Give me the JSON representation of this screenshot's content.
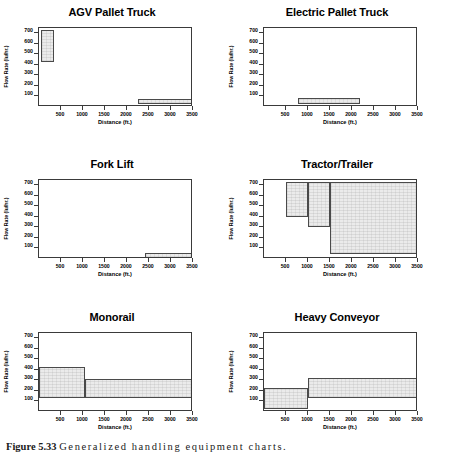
{
  "figure": {
    "caption_label": "Figure 5.33",
    "caption_text": "Generalized handling equipment charts."
  },
  "axes": {
    "xlabel": "Distance (ft.)",
    "ylabel": "Flow Rate (lu/hr.)",
    "xticks": [
      500,
      1000,
      1500,
      2000,
      2500,
      3000,
      3500
    ],
    "yticks": [
      100,
      200,
      300,
      400,
      500,
      600,
      700
    ],
    "xlim": [
      0,
      3500
    ],
    "ylim": [
      0,
      750
    ],
    "grid": false,
    "fill_color": "#ebebeb",
    "line_color": "#4a4a4a"
  },
  "panels": [
    {
      "title": "AGV Pallet Truck",
      "regions": [
        {
          "x0": 40,
          "x1": 350,
          "y0": 430,
          "y1": 735
        },
        {
          "x0": 2250,
          "x1": 3500,
          "y0": 30,
          "y1": 75
        }
      ]
    },
    {
      "title": "Electric Pallet Truck",
      "regions": [
        {
          "x0": 780,
          "x1": 2180,
          "y0": 30,
          "y1": 85
        }
      ]
    },
    {
      "title": "Fork Lift",
      "regions": [
        {
          "x0": 2420,
          "x1": 3500,
          "y0": 10,
          "y1": 55
        }
      ]
    },
    {
      "title": "Tractor/Trailer",
      "regions": [
        {
          "x0": 500,
          "x1": 1000,
          "y0": 400,
          "y1": 735
        },
        {
          "x0": 1000,
          "x1": 1500,
          "y0": 300,
          "y1": 735
        },
        {
          "x0": 1500,
          "x1": 3500,
          "y0": 50,
          "y1": 735
        }
      ]
    },
    {
      "title": "Monorail",
      "regions": [
        {
          "x0": 0,
          "x1": 1050,
          "y0": 130,
          "y1": 430
        },
        {
          "x0": 1050,
          "x1": 3500,
          "y0": 130,
          "y1": 310
        }
      ]
    },
    {
      "title": "Heavy Conveyor",
      "regions": [
        {
          "x0": 0,
          "x1": 1000,
          "y0": 30,
          "y1": 230
        },
        {
          "x0": 1000,
          "x1": 3500,
          "y0": 130,
          "y1": 320
        }
      ]
    }
  ],
  "chart_data": {
    "type": "area",
    "title": "Generalized handling equipment charts.",
    "xlabel": "Distance (ft.)",
    "ylabel": "Flow Rate (lu/hr.)",
    "xlim": [
      0,
      3500
    ],
    "ylim": [
      0,
      750
    ],
    "xticks": [
      500,
      1000,
      1500,
      2000,
      2500,
      3000,
      3500
    ],
    "yticks": [
      100,
      200,
      300,
      400,
      500,
      600,
      700
    ],
    "grid": false,
    "legend": null,
    "panel_layout": [
      2,
      3
    ],
    "series": [
      {
        "name": "AGV Pallet Truck",
        "envelope": [
          {
            "distance_from": 40,
            "distance_to": 350,
            "flow_min": 430,
            "flow_max": 735
          },
          {
            "distance_from": 2250,
            "distance_to": 3500,
            "flow_min": 30,
            "flow_max": 75
          }
        ]
      },
      {
        "name": "Electric Pallet Truck",
        "envelope": [
          {
            "distance_from": 780,
            "distance_to": 2180,
            "flow_min": 30,
            "flow_max": 85
          }
        ]
      },
      {
        "name": "Fork Lift",
        "envelope": [
          {
            "distance_from": 2420,
            "distance_to": 3500,
            "flow_min": 10,
            "flow_max": 55
          }
        ]
      },
      {
        "name": "Tractor/Trailer",
        "envelope": [
          {
            "distance_from": 500,
            "distance_to": 1000,
            "flow_min": 400,
            "flow_max": 735
          },
          {
            "distance_from": 1000,
            "distance_to": 1500,
            "flow_min": 300,
            "flow_max": 735
          },
          {
            "distance_from": 1500,
            "distance_to": 3500,
            "flow_min": 50,
            "flow_max": 735
          }
        ]
      },
      {
        "name": "Monorail",
        "envelope": [
          {
            "distance_from": 0,
            "distance_to": 1050,
            "flow_min": 130,
            "flow_max": 430
          },
          {
            "distance_from": 1050,
            "distance_to": 3500,
            "flow_min": 130,
            "flow_max": 310
          }
        ]
      },
      {
        "name": "Heavy Conveyor",
        "envelope": [
          {
            "distance_from": 0,
            "distance_to": 1000,
            "flow_min": 30,
            "flow_max": 230
          },
          {
            "distance_from": 1000,
            "distance_to": 3500,
            "flow_min": 130,
            "flow_max": 320
          }
        ]
      }
    ]
  }
}
